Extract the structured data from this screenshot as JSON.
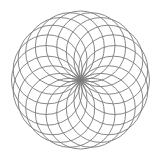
{
  "figure": {
    "type": "rosette",
    "center": [
      80.5,
      80
    ],
    "circle_count": 20,
    "circle_radius": 34.5,
    "stroke_color": "#7a7a7a",
    "stroke_width": 0.9,
    "background": "#ffffff"
  }
}
